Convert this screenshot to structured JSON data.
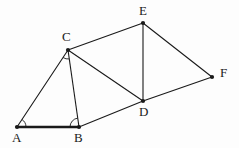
{
  "figure": {
    "background_color": "#fdfdfd",
    "stroke_color": "#1a1a1a",
    "label_color": "#1a1a1a",
    "width": 239,
    "height": 148
  },
  "points": [
    {
      "id": "A",
      "label": "A",
      "x": 17,
      "y": 127,
      "label_x": 12,
      "label_y": 131
    },
    {
      "id": "B",
      "label": "B",
      "x": 79,
      "y": 127,
      "label_x": 74,
      "label_y": 131
    },
    {
      "id": "C",
      "label": "C",
      "x": 68,
      "y": 50,
      "label_x": 62,
      "label_y": 30
    },
    {
      "id": "D",
      "label": "D",
      "x": 143,
      "y": 101,
      "label_x": 139,
      "label_y": 105
    },
    {
      "id": "E",
      "label": "E",
      "x": 143,
      "y": 23,
      "label_x": 139,
      "label_y": 4
    },
    {
      "id": "F",
      "label": "F",
      "x": 212,
      "y": 77,
      "label_x": 220,
      "label_y": 66
    }
  ],
  "segments": [
    {
      "from": "A",
      "to": "B",
      "emphasis": "bold",
      "stroke_width": 2.6
    },
    {
      "from": "A",
      "to": "C",
      "emphasis": "normal",
      "stroke_width": 1.1
    },
    {
      "from": "B",
      "to": "C",
      "emphasis": "normal",
      "stroke_width": 1.1
    },
    {
      "from": "B",
      "to": "D",
      "emphasis": "normal",
      "stroke_width": 1.1
    },
    {
      "from": "C",
      "to": "D",
      "emphasis": "normal",
      "stroke_width": 1.1
    },
    {
      "from": "C",
      "to": "E",
      "emphasis": "normal",
      "stroke_width": 1.1
    },
    {
      "from": "D",
      "to": "E",
      "emphasis": "normal",
      "stroke_width": 1.1
    },
    {
      "from": "D",
      "to": "F",
      "emphasis": "normal",
      "stroke_width": 1.1
    },
    {
      "from": "E",
      "to": "F",
      "emphasis": "normal",
      "stroke_width": 1.1
    }
  ],
  "angle_marks": [
    {
      "id": "angle-A",
      "vertex": "A",
      "arm1": "B",
      "arm2": "C",
      "radius": 9
    },
    {
      "id": "angle-B",
      "vertex": "B",
      "arm1": "A",
      "arm2": "C",
      "radius": 9
    },
    {
      "id": "angle-C",
      "vertex": "C",
      "arm1": "A",
      "arm2": "B",
      "radius": 9
    }
  ],
  "vertex_dot_radius": 2.1
}
